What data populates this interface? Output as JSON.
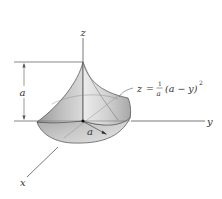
{
  "figure": {
    "type": "3d-surface-diagram",
    "axes": {
      "x": {
        "label": "x"
      },
      "y": {
        "label": "y"
      },
      "z": {
        "label": "z"
      }
    },
    "dimensions": {
      "height_label": "a",
      "radius_label": "a"
    },
    "equation": {
      "lhs": "z",
      "equals": "=",
      "frac_num": "1",
      "frac_den": "a",
      "body": "(a − y)",
      "exponent": "2",
      "full_text": "z = (1/a)(a − y)^2"
    },
    "colors": {
      "axis": "#555555",
      "surface_light": "#e4e4e4",
      "surface_mid": "#bdbdbd",
      "surface_dark": "#8f8f8f",
      "outline": "#4a4a4a"
    }
  }
}
